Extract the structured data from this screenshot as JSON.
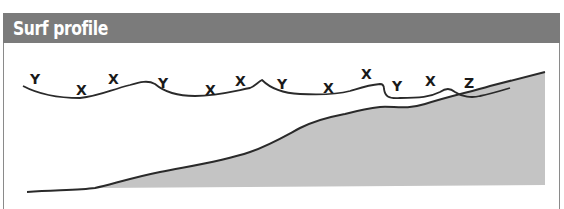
{
  "title": "Surf profile",
  "labels": [
    {
      "text": "Y",
      "x": 38,
      "y": 84
    },
    {
      "text": "X",
      "x": 82,
      "y": 95
    },
    {
      "text": "X",
      "x": 114,
      "y": 84
    },
    {
      "text": "Y",
      "x": 164,
      "y": 88
    },
    {
      "text": "X",
      "x": 211,
      "y": 95
    },
    {
      "text": "X",
      "x": 241,
      "y": 86
    },
    {
      "text": "Y",
      "x": 283,
      "y": 89
    },
    {
      "text": "X",
      "x": 329,
      "y": 93
    },
    {
      "text": "X",
      "x": 367,
      "y": 79
    },
    {
      "text": "Y",
      "x": 398,
      "y": 91
    },
    {
      "text": "X",
      "x": 431,
      "y": 86
    },
    {
      "text": "Z",
      "x": 470,
      "y": 88
    }
  ],
  "colors": {
    "header": "#7b7b7b",
    "seabed_fill": "#c4c4c4",
    "line": "#2a2a2a"
  }
}
